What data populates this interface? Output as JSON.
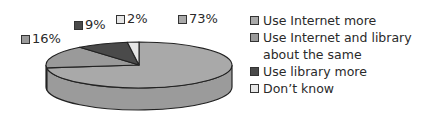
{
  "chart_data": {
    "type": "pie",
    "style": "3d",
    "title": "",
    "slices": [
      {
        "label": "Use Internet more",
        "value": 73,
        "display": "73%",
        "color": "#a9a9a9"
      },
      {
        "label": "Use Internet and library\nabout the same",
        "value": 16,
        "display": "16%",
        "color": "#9a9a9a"
      },
      {
        "label": "Use library more",
        "value": 9,
        "display": "9%",
        "color": "#4a4a4a"
      },
      {
        "label": "Don’t know",
        "value": 2,
        "display": "2%",
        "color": "#e6e6e6"
      }
    ],
    "start_angle": "12 o'clock",
    "direction": "clockwise",
    "legend_position": "right"
  }
}
